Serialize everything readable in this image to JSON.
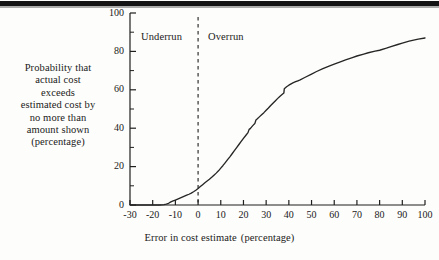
{
  "figure": {
    "background_color": "#fdfdfb",
    "ink_color": "#1f1f1f",
    "top_rule": "scan-edge-bar"
  },
  "annotations": {
    "underrun": "Underrun",
    "overrun": "Overrun"
  },
  "ylabel_lines": [
    "Probability that",
    "actual cost",
    "exceeds",
    "estimated cost by",
    "no more than",
    "amount shown",
    "(percentage)"
  ],
  "xlabel_parts": {
    "main": "Error in cost estimate",
    "unit": "(percentage)"
  },
  "chart_data": {
    "type": "line",
    "title": "",
    "subtitle": "",
    "xlabel": "Error in cost estimate  (percentage)",
    "ylabel": "Probability that actual cost exceeds estimated cost by no more than amount shown (percentage)",
    "xlim": [
      -30,
      100
    ],
    "ylim": [
      0,
      100
    ],
    "grid": false,
    "legend": "none",
    "x_ticks": [
      -30,
      -20,
      -10,
      0,
      10,
      20,
      30,
      40,
      50,
      60,
      70,
      80,
      90,
      100
    ],
    "x_tick_labels": [
      "-30",
      "-20",
      "-10",
      "0",
      "10",
      "20",
      "30",
      "40",
      "50",
      "60",
      "70",
      "80",
      "90",
      "100"
    ],
    "x_minor_tick_step": 10,
    "y_ticks": [
      0,
      20,
      40,
      60,
      80,
      100
    ],
    "y_tick_labels": [
      "0",
      "20",
      "40",
      "60",
      "80",
      "100"
    ],
    "y_minor_ticks": [
      10,
      30,
      50,
      70,
      90
    ],
    "reference_line": {
      "orientation": "vertical",
      "x": 0,
      "style": "dashed",
      "label_left": "Underrun",
      "label_right": "Overrun"
    },
    "series": [
      {
        "name": "Cumulative probability of cost error",
        "style": "solid",
        "points": [
          [
            -30,
            0.0
          ],
          [
            -25,
            0.0
          ],
          [
            -20,
            0.0
          ],
          [
            -17,
            0.0
          ],
          [
            -15,
            0.2
          ],
          [
            -14,
            0.5
          ],
          [
            -13,
            0.9
          ],
          [
            -12,
            1.6
          ],
          [
            -11,
            2.1
          ],
          [
            -10,
            2.6
          ],
          [
            -9,
            3.1
          ],
          [
            -8,
            3.6
          ],
          [
            -7,
            4.1
          ],
          [
            -6,
            4.6
          ],
          [
            -5,
            5.1
          ],
          [
            -4,
            5.6
          ],
          [
            -3,
            6.2
          ],
          [
            -2,
            6.9
          ],
          [
            -1,
            7.7
          ],
          [
            0,
            8.6
          ],
          [
            1,
            9.6
          ],
          [
            2,
            10.6
          ],
          [
            3,
            11.6
          ],
          [
            4,
            12.5
          ],
          [
            5,
            13.4
          ],
          [
            6,
            14.4
          ],
          [
            7,
            15.5
          ],
          [
            8,
            16.6
          ],
          [
            9,
            17.8
          ],
          [
            10,
            19.2
          ],
          [
            11,
            20.6
          ],
          [
            12,
            22.1
          ],
          [
            13,
            23.6
          ],
          [
            14,
            25.1
          ],
          [
            15,
            26.7
          ],
          [
            16,
            28.3
          ],
          [
            17,
            29.9
          ],
          [
            18,
            31.5
          ],
          [
            19,
            33.1
          ],
          [
            20,
            34.7
          ],
          [
            21,
            36.2
          ],
          [
            22,
            37.7
          ],
          [
            22.5,
            39.4
          ],
          [
            23,
            39.8
          ],
          [
            24,
            41.2
          ],
          [
            25,
            42.4
          ],
          [
            25.5,
            44.3
          ],
          [
            26,
            44.8
          ],
          [
            27,
            45.9
          ],
          [
            28,
            47.0
          ],
          [
            29,
            48.1
          ],
          [
            30,
            49.3
          ],
          [
            31,
            50.5
          ],
          [
            32,
            51.8
          ],
          [
            33,
            53.0
          ],
          [
            34,
            54.2
          ],
          [
            35,
            55.4
          ],
          [
            36,
            56.5
          ],
          [
            37,
            57.5
          ],
          [
            37.8,
            58.3
          ],
          [
            38,
            60.6
          ],
          [
            39,
            61.6
          ],
          [
            40,
            62.4
          ],
          [
            41,
            63.1
          ],
          [
            42,
            63.7
          ],
          [
            43,
            64.2
          ],
          [
            44,
            64.7
          ],
          [
            45,
            65.2
          ],
          [
            47,
            66.4
          ],
          [
            50,
            68.2
          ],
          [
            52,
            69.4
          ],
          [
            55,
            71.0
          ],
          [
            58,
            72.5
          ],
          [
            60,
            73.4
          ],
          [
            63,
            74.7
          ],
          [
            65,
            75.6
          ],
          [
            68,
            76.8
          ],
          [
            70,
            77.6
          ],
          [
            73,
            78.6
          ],
          [
            75,
            79.3
          ],
          [
            78,
            80.1
          ],
          [
            80,
            80.6
          ],
          [
            83,
            81.7
          ],
          [
            85,
            82.5
          ],
          [
            88,
            83.6
          ],
          [
            90,
            84.3
          ],
          [
            93,
            85.3
          ],
          [
            95,
            85.9
          ],
          [
            97,
            86.4
          ],
          [
            100,
            87.0
          ]
        ]
      }
    ]
  },
  "axis_geometry": {
    "plot_left_px": 130,
    "plot_right_px": 425,
    "plot_top_px": 13,
    "plot_bottom_px": 205
  }
}
